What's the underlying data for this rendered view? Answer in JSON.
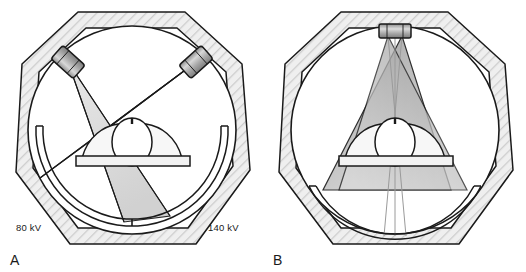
{
  "figure": {
    "background_color": "#ffffff",
    "ink_color": "#1a1a1a"
  },
  "panels": [
    {
      "id": "A",
      "letter": "A",
      "caption": "Dual-source: two x-ray tubes at different kV offset 90 degrees",
      "tube_count": 2,
      "labels": {
        "left_kv": "80 kV",
        "right_kv": "140 kV"
      },
      "components": [
        "gantry-housing",
        "gantry-bore",
        "xray-tube-left",
        "xray-tube-right",
        "fan-beam-left",
        "fan-beam-right",
        "detector-arc-left",
        "detector-arc-right",
        "patient",
        "patient-table"
      ],
      "colors": {
        "housing_fill": "#eeeeee",
        "hatch": "#c9c9c9",
        "beam_light": "#d9d9d9",
        "beam_dark": "#9a9a9a",
        "tube_body": "#b0b0b0"
      }
    },
    {
      "id": "B",
      "letter": "B",
      "caption": "Single-source rapid kV switching: one tube, two beams",
      "tube_count": 1,
      "labels": {},
      "components": [
        "gantry-housing",
        "gantry-bore",
        "xray-tube-top",
        "fan-beam-a",
        "fan-beam-b",
        "detector-arc-bottom",
        "patient",
        "patient-table"
      ],
      "colors": {
        "housing_fill": "#eeeeee",
        "hatch": "#c9c9c9",
        "beam_light": "#d4d4d4",
        "beam_dark": "#8f8f8f",
        "tube_body": "#b0b0b0"
      }
    }
  ]
}
